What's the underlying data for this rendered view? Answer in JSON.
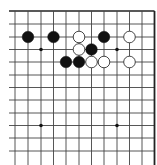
{
  "board": {
    "type": "go-board-fragment",
    "colors": {
      "background": "#ffffff",
      "line": "#444444",
      "edge": "#222222",
      "black_stone": "#111111",
      "white_stone": "#ffffff",
      "white_outline": "#333333",
      "star": "#111111"
    },
    "columns_x": [
      15,
      28,
      41,
      53.5,
      66,
      79,
      91.5,
      104,
      117,
      129.5,
      142,
      154.5
    ],
    "rows_y": [
      11,
      24,
      37,
      49.5,
      62,
      75,
      87.5,
      100,
      113,
      125.5,
      138,
      151
    ],
    "top_edge": true,
    "right_edge": true,
    "star_points": [
      [
        2,
        3
      ],
      [
        8,
        3
      ],
      [
        2,
        9
      ],
      [
        8,
        9
      ]
    ],
    "stones": [
      {
        "col": 1,
        "row": 2,
        "color": "black"
      },
      {
        "col": 3,
        "row": 2,
        "color": "black"
      },
      {
        "col": 5,
        "row": 2,
        "color": "white"
      },
      {
        "col": 7,
        "row": 2,
        "color": "black"
      },
      {
        "col": 9,
        "row": 2,
        "color": "white"
      },
      {
        "col": 5,
        "row": 3,
        "color": "white"
      },
      {
        "col": 6,
        "row": 3,
        "color": "black"
      },
      {
        "col": 4,
        "row": 4,
        "color": "black"
      },
      {
        "col": 5,
        "row": 4,
        "color": "black"
      },
      {
        "col": 6,
        "row": 4,
        "color": "white"
      },
      {
        "col": 7,
        "row": 4,
        "color": "white"
      },
      {
        "col": 9,
        "row": 4,
        "color": "white"
      }
    ],
    "stone_radius": 5.8
  }
}
